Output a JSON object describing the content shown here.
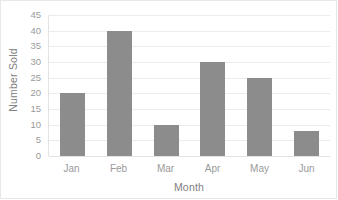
{
  "chart_data": {
    "type": "bar",
    "title": "",
    "subtitle": "",
    "categories": [
      "Jan",
      "Feb",
      "Mar",
      "Apr",
      "May",
      "Jun"
    ],
    "values": [
      20,
      40,
      10,
      30,
      25,
      8
    ],
    "series": [
      {
        "name": "Number Sold",
        "values": [
          20,
          40,
          10,
          30,
          25,
          8
        ]
      }
    ],
    "xlabel": "Month",
    "ylabel": "Number Sold",
    "ylim": [
      0,
      45
    ],
    "ytick_step": 5,
    "yticks": [
      45,
      40,
      35,
      30,
      25,
      20,
      15,
      10,
      5,
      0
    ],
    "grid": true,
    "grid_axis": "y",
    "legend": false,
    "legend_position": "none",
    "annotations": [],
    "colors": {
      "bar": "#8C8C8C",
      "gridline": "#ECECEC",
      "axis_line": "#E3E3E3",
      "tick_text": "#9A9A9A",
      "axis_title_text": "#808080",
      "plot_background": "#FFFFFF",
      "frame_border": "#E8E8E8"
    }
  }
}
